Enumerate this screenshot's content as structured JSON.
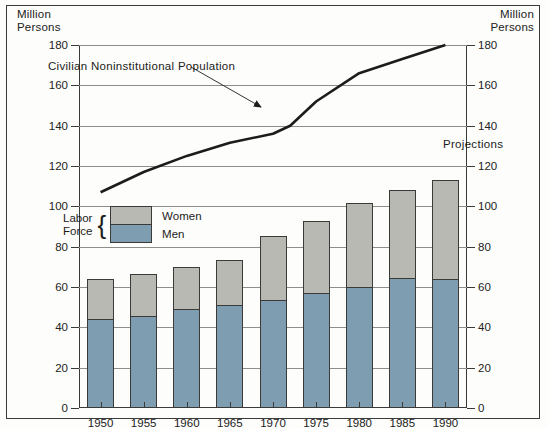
{
  "axis_titles": {
    "left": "Million\nPersons",
    "right": "Million\nPersons"
  },
  "legend": {
    "group_label_line1": "Labor",
    "group_label_line2": "Force",
    "brace": "{",
    "items": [
      {
        "name": "Women",
        "color": "#b9b9b4"
      },
      {
        "name": "Men",
        "color": "#7e9db1"
      }
    ]
  },
  "annotations": [
    {
      "name": "population-line-label",
      "text": "Civilian  Noninstitutional  Population"
    },
    {
      "name": "projections-label",
      "text": "Projections"
    }
  ],
  "colors": {
    "women": "#b9b9b4",
    "men": "#7e9db1",
    "line": "#1c1c1c",
    "grid": "#8d8d8a",
    "frame": "#3a3a38",
    "background": "#fdfdfb"
  },
  "chart_data": {
    "type": "bar",
    "title": "",
    "subtitle": "",
    "xlabel": "",
    "ylabel": "Million Persons",
    "ylim": [
      0,
      180
    ],
    "yticks": [
      0,
      20,
      40,
      60,
      80,
      100,
      120,
      140,
      160,
      180
    ],
    "ytick_labels": [
      "0",
      "20",
      "40",
      "60",
      "80",
      "100",
      "120",
      "140",
      "160",
      "180"
    ],
    "grid": true,
    "legend_position": "inside-left",
    "categories": [
      "1950",
      "1955",
      "1960",
      "1965",
      "1970",
      "1975",
      "1980",
      "1985",
      "1990"
    ],
    "series": [
      {
        "name": "Men",
        "stack": "labor-force",
        "values": [
          43.5,
          45,
          48.5,
          50.5,
          53,
          56.5,
          59.5,
          64,
          63.5
        ]
      },
      {
        "name": "Women",
        "stack": "labor-force",
        "values": [
          20.5,
          21.5,
          21.5,
          23,
          32.5,
          36,
          42,
          44,
          49.5
        ]
      }
    ],
    "stacked_totals": [
      64,
      66.5,
      70,
      73.5,
      85.5,
      92.5,
      101.5,
      108,
      113
    ],
    "line_series": {
      "name": "Civilian Noninstitutional Population",
      "x": [
        "1950",
        "1955",
        "1960",
        "1965",
        "1970",
        "1972",
        "1975",
        "1980",
        "1985",
        "1990"
      ],
      "values": [
        107,
        117,
        125,
        131.5,
        136,
        140,
        152,
        166,
        173,
        180
      ]
    }
  }
}
